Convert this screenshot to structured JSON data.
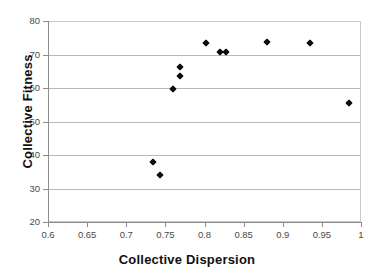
{
  "figure": {
    "title_remnant": "",
    "background_color": "#ffffff",
    "marker_color": "#0d0d0d",
    "grid_color": "#b9b9b9",
    "axis_color": "#8c8c8c"
  },
  "chart_data": {
    "type": "scatter",
    "title": "",
    "xlabel": "Collective Dispersion",
    "ylabel": "Collective Fitness",
    "xlim": [
      0.6,
      1.0
    ],
    "ylim": [
      20,
      80
    ],
    "xticks": [
      0.6,
      0.65,
      0.7,
      0.75,
      0.8,
      0.85,
      0.9,
      0.95,
      1
    ],
    "xtick_labels": [
      "0.6",
      "0.65",
      "0.7",
      "0.75",
      "0.8",
      "0.85",
      "0.9",
      "0.95",
      "1"
    ],
    "yticks": [
      20,
      30,
      40,
      50,
      60,
      70,
      80
    ],
    "ytick_labels": [
      "20",
      "30",
      "40",
      "50",
      "60",
      "70",
      "80"
    ],
    "grid": "horizontal",
    "legend": "none",
    "marker": "diamond",
    "series": [
      {
        "name": "Collective Fitness",
        "points": [
          {
            "x": 0.733,
            "y": 38.3
          },
          {
            "x": 0.742,
            "y": 34.3
          },
          {
            "x": 0.759,
            "y": 60.0
          },
          {
            "x": 0.767,
            "y": 64.0
          },
          {
            "x": 0.767,
            "y": 66.5
          },
          {
            "x": 0.8,
            "y": 73.7
          },
          {
            "x": 0.818,
            "y": 71.0
          },
          {
            "x": 0.826,
            "y": 71.0
          },
          {
            "x": 0.878,
            "y": 74.0
          },
          {
            "x": 0.933,
            "y": 73.7
          },
          {
            "x": 0.983,
            "y": 55.7
          }
        ]
      }
    ]
  }
}
